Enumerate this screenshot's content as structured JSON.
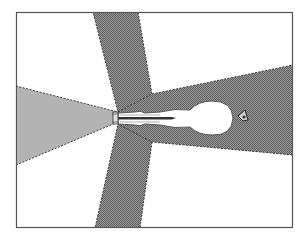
{
  "diagram": {
    "type": "top-view coverage / radiation pattern",
    "frame": {
      "x": 16,
      "y": 12,
      "width": 277,
      "height": 216,
      "stroke": "#555555",
      "background": "#ffffff"
    },
    "colors": {
      "hatched_zone": "#8a8a8a",
      "hatched_zone_dark": "#6e6e6e",
      "cone_zone": "#b3b3b3",
      "dashed_edge": "#3a3a3a",
      "figure_fill": "#ffffff",
      "figure_stroke": "#555555"
    },
    "regions": [
      {
        "name": "vertical-band-top",
        "fill": "hatched"
      },
      {
        "name": "vertical-band-bottom",
        "fill": "hatched"
      },
      {
        "name": "right-beam",
        "fill": "hatched"
      },
      {
        "name": "left-cone",
        "fill": "light-gray"
      }
    ],
    "elements": [
      {
        "name": "person-top-view"
      },
      {
        "name": "device-nozzle"
      },
      {
        "name": "small-object-icon"
      }
    ]
  }
}
